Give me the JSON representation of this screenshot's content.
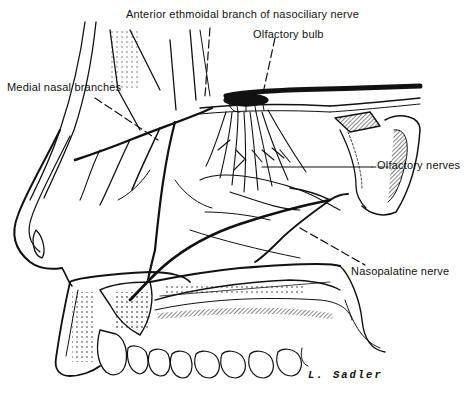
{
  "figure": {
    "labels": {
      "anterior_ethmoidal": "Anterior ethmoidal branch of nasociliary nerve",
      "olfactory_bulb": "Olfactory bulb",
      "medial_nasal": "Medial nasal branches",
      "olfactory_nerves": "Olfactory nerves",
      "nasopalatine": "Nasopalatine nerve"
    },
    "signature": "L. Sadler",
    "colors": {
      "ink": "#111111",
      "background": "#ffffff"
    }
  }
}
